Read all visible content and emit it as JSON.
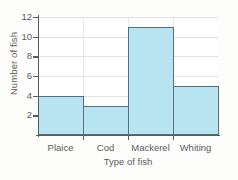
{
  "chart_data": {
    "type": "bar",
    "title": "",
    "subtitle": "",
    "xlabel": "Type of fish",
    "ylabel": "Number of fish",
    "categories": [
      "Plaice",
      "Cod",
      "Mackerel",
      "Whiting"
    ],
    "values": [
      4,
      3,
      11,
      5
    ],
    "ylim": [
      0,
      12
    ],
    "ytick_labels": [
      "2",
      "4",
      "6",
      "8",
      "10",
      "12"
    ],
    "ytick_values": [
      2,
      4,
      6,
      8,
      10,
      12
    ],
    "grid": "horizontal-and-vertical",
    "legend": "none",
    "bar_gap": "none",
    "colors": {
      "bar_fill": "#b8e4f2",
      "bar_border": "#53707c",
      "axis": "#5a5a5a",
      "gridline": "#e2e2e2",
      "text": "#5c5c5c",
      "plot_background": "#ffffff",
      "figure_background": "#fdfdfc"
    }
  }
}
